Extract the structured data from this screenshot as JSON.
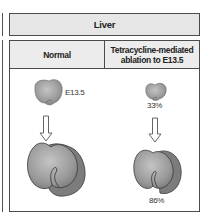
{
  "panel": {
    "title": "Liver",
    "columns": [
      {
        "header": "Normal",
        "stage_label": "E13.5",
        "small_liver_label": "",
        "large_liver_label": ""
      },
      {
        "header": "Tetracycline-mediated ablation to E13.5",
        "stage_label": "",
        "small_liver_label": "33%",
        "large_liver_label": "86%"
      }
    ]
  },
  "colors": {
    "border": "#4a4a4a",
    "header_fill": "#e6e6e6",
    "liver_fill": "#9a9a9a",
    "liver_shadow": "#7c7c7c",
    "liver_outline": "#3a3a3a"
  }
}
